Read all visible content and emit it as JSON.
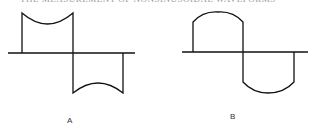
{
  "caption": "THE MEASUREMENT OF NONSINUSOIDAL WAVEFORMS",
  "figures": [
    {
      "label": "A",
      "description": "Square-like wave with concave (dipped) top and raised concave bottom"
    },
    {
      "label": "B",
      "description": "Square-like wave with convex (rounded) top and bottom, resembling clipped sine"
    }
  ],
  "colors": {
    "line": "#111111",
    "background": "#ffffff"
  }
}
